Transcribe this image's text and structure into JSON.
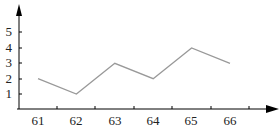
{
  "chart_data": {
    "type": "line",
    "title": "",
    "xlabel": "",
    "ylabel": "",
    "categories": [
      "61",
      "62",
      "63",
      "64",
      "65",
      "66"
    ],
    "values": [
      2,
      1,
      3,
      2,
      4,
      3
    ],
    "y_ticks": [
      "1",
      "2",
      "3",
      "4",
      "5"
    ],
    "ylim": [
      0,
      5
    ],
    "grid": false,
    "legend": null,
    "colors": {
      "line": "#999999",
      "axis": "#000000"
    }
  }
}
